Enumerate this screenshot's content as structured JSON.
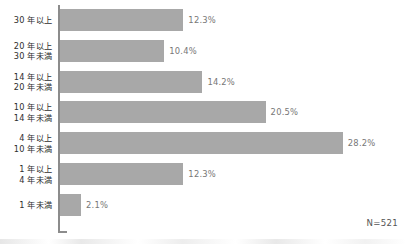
{
  "chart_data": {
    "type": "bar",
    "orientation": "horizontal",
    "title": "",
    "xlabel": "",
    "ylabel": "",
    "grid": false,
    "legend": false,
    "xlim": [
      0,
      30
    ],
    "unit": "%",
    "categories": [
      "30 年以上",
      "20 年以上\n30 年未満",
      "14 年以上\n20 年未満",
      "10 年以上\n14 年未満",
      "4 年以上\n10 年未満",
      "1 年以上\n4 年未満",
      "1 年未満"
    ],
    "values": [
      12.3,
      10.4,
      14.2,
      20.5,
      28.2,
      12.3,
      2.1
    ],
    "value_labels": [
      "12.3%",
      "10.4%",
      "14.2%",
      "20.5%",
      "28.2%",
      "12.3%",
      "2.1%"
    ],
    "annotation": "N=521",
    "colors": {
      "bar": "#a8a8a8",
      "axis": "#8c8c8c",
      "category_text": "#2e2e2e",
      "value_text": "#777777",
      "background": "#ffffff"
    }
  }
}
